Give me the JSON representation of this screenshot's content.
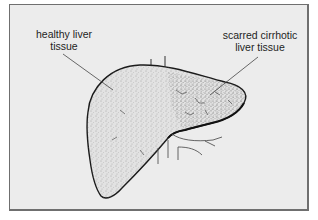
{
  "diagram": {
    "labels": [
      {
        "id": "healthy",
        "line1": "healthy liver",
        "line2": "tissue"
      },
      {
        "id": "cirrhotic",
        "line1": "scarred cirrhotic",
        "line2": "liver tissue"
      }
    ],
    "colors": {
      "background": "#ececec",
      "frame_border": "#6f6f6f",
      "outline": "#1a1a1a",
      "stipple": "#555555",
      "leader_line": "#444444"
    }
  }
}
